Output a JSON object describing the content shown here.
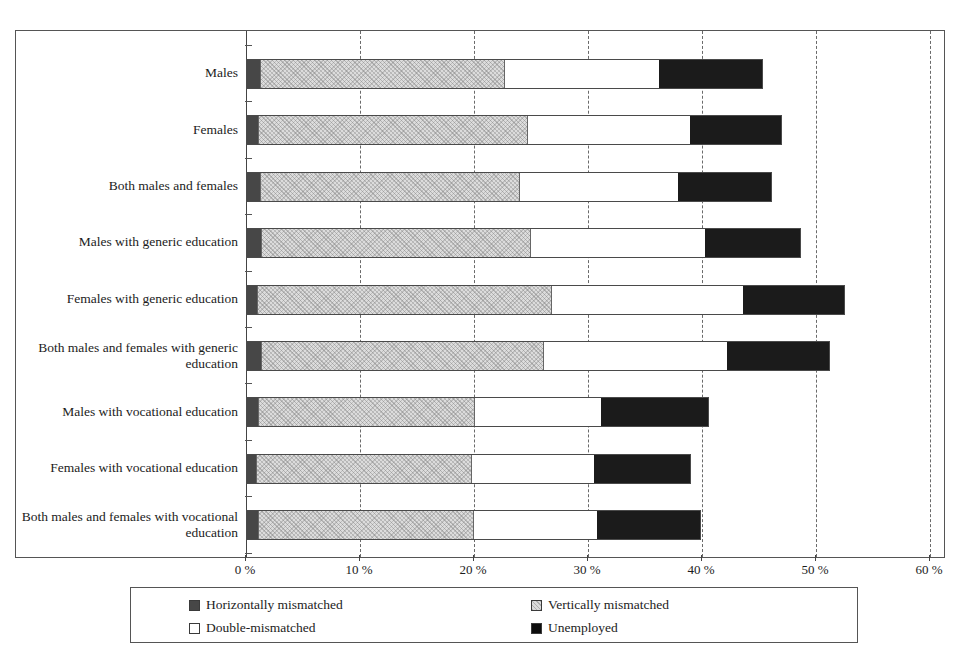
{
  "chart_data": {
    "type": "bar",
    "orientation": "horizontal",
    "stacked": true,
    "title": "",
    "xlabel": "",
    "ylabel": "",
    "xlim": [
      0,
      60
    ],
    "xticks": [
      0,
      10,
      20,
      30,
      40,
      50,
      60
    ],
    "xtick_labels": [
      "0 %",
      "10 %",
      "20 %",
      "30 %",
      "40 %",
      "50 %",
      "60 %"
    ],
    "grid": "vertical-dashed",
    "legend_position": "bottom",
    "categories": [
      "Males",
      "Females",
      "Both males and females",
      "Males with generic education",
      "Females with generic education",
      "Both males and females with generic education",
      "Males with vocational education",
      "Females with vocational education",
      "Both males and females with vocational education"
    ],
    "series": [
      {
        "name": "Horizontally mismatched",
        "color": "#474747",
        "values": [
          1.1,
          1.0,
          1.1,
          1.2,
          0.9,
          1.2,
          1.0,
          0.8,
          1.0
        ]
      },
      {
        "name": "Vertically mismatched",
        "color": "#dcdcdc",
        "values": [
          21.4,
          23.5,
          22.7,
          23.5,
          25.7,
          24.7,
          18.8,
          18.8,
          18.7
        ]
      },
      {
        "name": "Double-mismatched",
        "color": "#ffffff",
        "values": [
          13.5,
          14.2,
          13.8,
          15.3,
          16.7,
          16.0,
          11.1,
          10.7,
          10.8
        ]
      },
      {
        "name": "Unemployed",
        "color": "#1b1b1b",
        "values": [
          9.0,
          8.0,
          8.2,
          8.3,
          8.9,
          9.0,
          9.4,
          8.4,
          9.1
        ]
      }
    ],
    "totals": [
      45.0,
      46.7,
      45.8,
      48.3,
      52.2,
      50.9,
      40.3,
      38.7,
      39.6
    ]
  },
  "legend": {
    "items": [
      {
        "label": "Horizontally mismatched",
        "swatch": "dark-gray-swatch"
      },
      {
        "label": "Vertically mismatched",
        "swatch": "light-gray-swatch"
      },
      {
        "label": "Double-mismatched",
        "swatch": "white-swatch"
      },
      {
        "label": "Unemployed",
        "swatch": "black-swatch"
      }
    ]
  }
}
